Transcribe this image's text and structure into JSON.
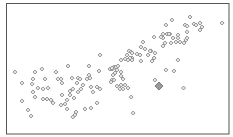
{
  "chart_data": {
    "type": "scatter",
    "title": "",
    "xlabel": "",
    "ylabel": "",
    "xlim": [
      0,
      100
    ],
    "ylim": [
      0,
      100
    ],
    "grid": false,
    "legend": null,
    "frame": true,
    "marker": "diamond",
    "colors": {
      "marker_stroke": "#8c8c8c",
      "marker_fill": "#e6e6e6",
      "highlight_fill": "#9a9a9a",
      "frame": "#555555"
    },
    "series": [
      {
        "name": "points",
        "points": [
          [
            7.2,
            25.2
          ],
          [
            4.0,
            47.3
          ],
          [
            7.2,
            38.9
          ],
          [
            13.0,
            47.3
          ],
          [
            16.1,
            49.6
          ],
          [
            22.4,
            47.3
          ],
          [
            12.1,
            42.0
          ],
          [
            11.7,
            38.2
          ],
          [
            17.5,
            42.0
          ],
          [
            12.1,
            32.1
          ],
          [
            14.3,
            35.1
          ],
          [
            16.6,
            34.4
          ],
          [
            18.8,
            35.1
          ],
          [
            13.0,
            28.2
          ],
          [
            16.6,
            26.7
          ],
          [
            18.4,
            26.7
          ],
          [
            20.2,
            26.0
          ],
          [
            21.1,
            23.7
          ],
          [
            9.9,
            18.3
          ],
          [
            11.2,
            13.7
          ],
          [
            23.3,
            42.0
          ],
          [
            27.8,
            51.9
          ],
          [
            37.2,
            51.9
          ],
          [
            42.2,
            60.3
          ],
          [
            41.7,
            48.1
          ],
          [
            24.7,
            42.0
          ],
          [
            25.1,
            38.9
          ],
          [
            25.1,
            29.8
          ],
          [
            29.6,
            42.7
          ],
          [
            32.3,
            42.7
          ],
          [
            33.2,
            42.0
          ],
          [
            31.8,
            38.9
          ],
          [
            34.5,
            37.4
          ],
          [
            36.3,
            42.0
          ],
          [
            37.2,
            45.0
          ],
          [
            37.7,
            42.7
          ],
          [
            28.7,
            32.8
          ],
          [
            30.0,
            34.4
          ],
          [
            28.7,
            29.8
          ],
          [
            30.5,
            27.5
          ],
          [
            27.4,
            26.0
          ],
          [
            26.5,
            22.9
          ],
          [
            24.7,
            22.1
          ],
          [
            33.6,
            34.4
          ],
          [
            32.3,
            32.1
          ],
          [
            38.1,
            35.9
          ],
          [
            39.0,
            32.1
          ],
          [
            40.8,
            35.9
          ],
          [
            42.2,
            34.4
          ],
          [
            27.4,
            19.1
          ],
          [
            30.0,
            13.0
          ],
          [
            30.9,
            14.5
          ],
          [
            31.4,
            16.8
          ],
          [
            35.4,
            19.1
          ],
          [
            38.1,
            19.8
          ],
          [
            40.8,
            23.7
          ],
          [
            46.6,
            49.6
          ],
          [
            47.5,
            49.6
          ],
          [
            48.4,
            51.1
          ],
          [
            49.3,
            51.1
          ],
          [
            48.0,
            50.1
          ],
          [
            50.2,
            51.9
          ],
          [
            51.6,
            56.5
          ],
          [
            53.4,
            57.3
          ],
          [
            54.7,
            56.5
          ],
          [
            56.5,
            58.0
          ],
          [
            56.5,
            56.5
          ],
          [
            54.3,
            60.3
          ],
          [
            55.6,
            58.0
          ],
          [
            55.2,
            63.4
          ],
          [
            56.1,
            62.6
          ],
          [
            47.5,
            50.4
          ],
          [
            49.8,
            48.9
          ],
          [
            51.6,
            47.3
          ],
          [
            48.9,
            46.6
          ],
          [
            48.0,
            45.0
          ],
          [
            51.6,
            44.3
          ],
          [
            52.5,
            42.0
          ],
          [
            47.5,
            41.2
          ],
          [
            47.1,
            39.7
          ],
          [
            48.4,
            41.2
          ],
          [
            51.6,
            37.4
          ],
          [
            53.4,
            37.4
          ],
          [
            49.8,
            36.6
          ],
          [
            51.1,
            34.4
          ],
          [
            52.5,
            34.4
          ],
          [
            54.7,
            35.1
          ],
          [
            56.1,
            28.2
          ],
          [
            57.0,
            16.0
          ],
          [
            66.4,
            74.0
          ],
          [
            70.4,
            73.3
          ],
          [
            73.5,
            76.3
          ],
          [
            61.4,
            70.2
          ],
          [
            60.5,
            66.4
          ],
          [
            62.3,
            64.9
          ],
          [
            65.0,
            63.4
          ],
          [
            66.8,
            61.8
          ],
          [
            66.4,
            58.0
          ],
          [
            65.5,
            55.7
          ],
          [
            60.1,
            60.3
          ],
          [
            60.5,
            55.7
          ],
          [
            58.7,
            61.1
          ],
          [
            56.5,
            61.8
          ],
          [
            74.4,
            87.0
          ],
          [
            82.5,
            89.3
          ],
          [
            80.3,
            83.2
          ],
          [
            81.2,
            82.4
          ],
          [
            84.3,
            84.0
          ],
          [
            87.0,
            84.7
          ],
          [
            87.9,
            81.7
          ],
          [
            87.0,
            79.4
          ],
          [
            85.2,
            83.2
          ],
          [
            81.2,
            77.9
          ],
          [
            71.7,
            83.2
          ],
          [
            72.2,
            76.3
          ],
          [
            73.1,
            76.3
          ],
          [
            70.4,
            76.3
          ],
          [
            74.0,
            69.5
          ],
          [
            77.1,
            75.6
          ],
          [
            77.1,
            73.3
          ],
          [
            78.0,
            70.2
          ],
          [
            79.8,
            69.5
          ],
          [
            80.7,
            71.8
          ],
          [
            81.2,
            73.3
          ],
          [
            69.5,
            74.0
          ],
          [
            70.4,
            67.2
          ],
          [
            71.3,
            69.5
          ],
          [
            74.9,
            73.3
          ],
          [
            76.2,
            70.2
          ],
          [
            63.7,
            60.3
          ],
          [
            64.6,
            63.4
          ],
          [
            66.4,
            58.0
          ],
          [
            77.1,
            56.5
          ],
          [
            71.7,
            48.9
          ],
          [
            75.3,
            48.1
          ],
          [
            66.8,
            41.2
          ],
          [
            79.6,
            35.1
          ],
          [
            96.9,
            84.7
          ]
        ]
      },
      {
        "name": "highlight",
        "points": [
          [
            68.6,
            36.6
          ]
        ]
      }
    ]
  }
}
